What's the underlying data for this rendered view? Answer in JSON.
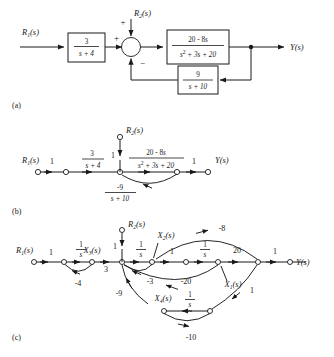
{
  "figure": {
    "captions": {
      "a": "(a)",
      "b": "(b)",
      "c": "(c)"
    }
  },
  "part_a": {
    "inputs": [
      {
        "name": "r1",
        "label_main": "R",
        "label_sub": "1",
        "label_tail": "(s)"
      },
      {
        "name": "r2",
        "label_main": "R",
        "label_sub": "2",
        "label_tail": "(s)"
      }
    ],
    "output": {
      "label_main": "Y",
      "label_tail": "(s)"
    },
    "blocks": [
      {
        "name": "forward-gain-block",
        "num": "3",
        "den_main": "s + 4",
        "den_sub": ""
      },
      {
        "name": "plant-block",
        "num_main": "20 - 8",
        "num_var": "s",
        "den_pre": "s",
        "den_exp": "2",
        "den_post": " + 3s + 20"
      },
      {
        "name": "feedback-block",
        "num": "9",
        "den_main": "s + 10"
      }
    ],
    "summing_junction": {
      "name": "summing-junction",
      "sign_left": "+",
      "sign_top": "+",
      "sign_bottom": "−"
    }
  },
  "part_b": {
    "nodes": [
      {
        "name": "node-r1",
        "label_main": "R",
        "label_sub": "1",
        "label_tail": "(s)"
      },
      {
        "name": "node-r2",
        "label_main": "R",
        "label_sub": "2",
        "label_tail": "(s)"
      },
      {
        "name": "node-y",
        "label_main": "Y",
        "label_tail": "(s)"
      }
    ],
    "branch_gains": {
      "input_gain": "1",
      "r2_gain": "1",
      "output_gain": "1",
      "g1_num": "3",
      "g1_den": "s + 4",
      "g2_num_main": "20 - 8",
      "g2_num_var": "s",
      "g2_den_pre": "s",
      "g2_den_exp": "2",
      "g2_den_post": " + 3s + 20",
      "h_num": "-9",
      "h_den": "s + 10"
    }
  },
  "part_c": {
    "nodes": [
      {
        "name": "node-r1",
        "label_main": "R",
        "label_sub": "1",
        "label_tail": "(s)"
      },
      {
        "name": "node-r2",
        "label_main": "R",
        "label_sub": "2",
        "label_tail": "(s)"
      },
      {
        "name": "node-x1",
        "label_main": "X",
        "label_sub": "1",
        "label_tail": "(s)"
      },
      {
        "name": "node-x2",
        "label_main": "X",
        "label_sub": "2",
        "label_tail": "(s)"
      },
      {
        "name": "node-x3",
        "label_main": "X",
        "label_sub": "3",
        "label_tail": "(s)"
      },
      {
        "name": "node-x4",
        "label_main": "X",
        "label_sub": "4",
        "label_tail": "(s)"
      },
      {
        "name": "node-y",
        "label_main": "Y",
        "label_tail": "(s)"
      }
    ],
    "integrators": {
      "int_x3_num": "1",
      "int_x3_den": "s",
      "int_x2_num": "1",
      "int_x2_den": "s",
      "int_x1_num": "1",
      "int_x1_den": "s",
      "int_x4_num": "1",
      "int_x4_den": "s"
    },
    "gains": {
      "input": "1",
      "r2_input": "1",
      "output": "1",
      "x3_selfloop": "-4",
      "x3_to_sum": "3",
      "x2_to_x1_path": "1",
      "x1_to_y": "20",
      "x2_feedback": "-3",
      "x1_feedback": "-20",
      "top_feedback": "-8",
      "x4_branch": "-9",
      "x4_selfloop": "-10",
      "y_to_x4": "1"
    }
  }
}
